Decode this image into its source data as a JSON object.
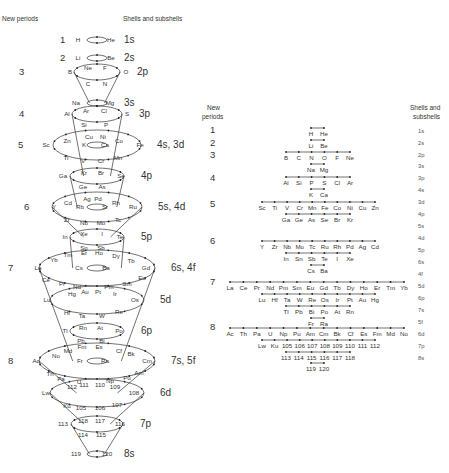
{
  "left_panel": {
    "header_periods": "New periods",
    "header_shells": "Shells and subshells",
    "rings": [
      {
        "period": "1",
        "shell": "1s",
        "cy": 40,
        "rx": 10,
        "ry": 3,
        "elements": [
          {
            "s": "H",
            "x": 78,
            "y": 42
          },
          {
            "s": "He",
            "x": 111,
            "y": 42
          }
        ]
      },
      {
        "period": "2",
        "shell": "2s",
        "cy": 58,
        "rx": 10,
        "ry": 3,
        "elements": [
          {
            "s": "Li",
            "x": 78,
            "y": 60
          },
          {
            "s": "Be",
            "x": 111,
            "y": 60
          }
        ]
      },
      {
        "period": "3",
        "shell": "2p",
        "cy": 72,
        "rx": 23,
        "ry": 8,
        "elements": [
          {
            "s": "B",
            "x": 70,
            "y": 74
          },
          {
            "s": "Ne",
            "x": 88,
            "y": 70
          },
          {
            "s": "F",
            "x": 105,
            "y": 70
          },
          {
            "s": "O",
            "x": 126,
            "y": 74
          },
          {
            "s": "C",
            "x": 88,
            "y": 86
          },
          {
            "s": "N",
            "x": 105,
            "y": 86
          }
        ]
      },
      {
        "period": "",
        "shell": "3s",
        "cy": 103,
        "rx": 10,
        "ry": 3,
        "elements": [
          {
            "s": "Na",
            "x": 76,
            "y": 105
          },
          {
            "s": "Mg",
            "x": 110,
            "y": 105
          }
        ]
      },
      {
        "period": "4",
        "shell": "3p",
        "cy": 114,
        "rx": 25,
        "ry": 8,
        "elements": [
          {
            "s": "Al",
            "x": 67,
            "y": 116
          },
          {
            "s": "Ar",
            "x": 86,
            "y": 113
          },
          {
            "s": "Cl",
            "x": 104,
            "y": 113
          },
          {
            "s": "S",
            "x": 127,
            "y": 116
          },
          {
            "s": "Si",
            "x": 84,
            "y": 127
          },
          {
            "s": "P",
            "x": 106,
            "y": 127
          }
        ]
      },
      {
        "period": "5",
        "shell": "4s, 3d",
        "cy": 145,
        "rx": 44,
        "ry": 15,
        "inner_rx": 10,
        "inner_ry": 3,
        "elements": [
          {
            "s": "Sc",
            "x": 46,
            "y": 147
          },
          {
            "s": "Zn",
            "x": 67,
            "y": 143
          },
          {
            "s": "Cu",
            "x": 89,
            "y": 139
          },
          {
            "s": "Ni",
            "x": 103,
            "y": 139
          },
          {
            "s": "Co",
            "x": 119,
            "y": 143
          },
          {
            "s": "Fe",
            "x": 140,
            "y": 147
          },
          {
            "s": "K",
            "x": 84,
            "y": 147
          },
          {
            "s": "Ca",
            "x": 105,
            "y": 147
          },
          {
            "s": "Ti",
            "x": 66,
            "y": 160
          },
          {
            "s": "V",
            "x": 83,
            "y": 163
          },
          {
            "s": "Cr",
            "x": 101,
            "y": 163
          },
          {
            "s": "Mn",
            "x": 118,
            "y": 160
          }
        ]
      },
      {
        "period": "",
        "shell": "4p",
        "cy": 176,
        "rx": 27,
        "ry": 8,
        "elements": [
          {
            "s": "Ga",
            "x": 63,
            "y": 178
          },
          {
            "s": "Kr",
            "x": 84,
            "y": 175
          },
          {
            "s": "Br",
            "x": 101,
            "y": 175
          },
          {
            "s": "Se",
            "x": 121,
            "y": 178
          },
          {
            "s": "Ge",
            "x": 83,
            "y": 189
          },
          {
            "s": "As",
            "x": 102,
            "y": 189
          }
        ]
      },
      {
        "period": "6",
        "shell": "5s, 4d",
        "cy": 207,
        "rx": 45,
        "ry": 15,
        "inner_rx": 10,
        "inner_ry": 3,
        "elements": [
          {
            "s": "Y",
            "x": 54,
            "y": 209
          },
          {
            "s": "Cd",
            "x": 68,
            "y": 205
          },
          {
            "s": "Ag",
            "x": 87,
            "y": 201
          },
          {
            "s": "Pd",
            "x": 98,
            "y": 201
          },
          {
            "s": "Rh",
            "x": 116,
            "y": 205
          },
          {
            "s": "Ru",
            "x": 133,
            "y": 209
          },
          {
            "s": "Rb",
            "x": 80,
            "y": 209
          },
          {
            "s": "Sr",
            "x": 105,
            "y": 209
          },
          {
            "s": "Zr",
            "x": 67,
            "y": 222
          },
          {
            "s": "Nb",
            "x": 84,
            "y": 225
          },
          {
            "s": "Mo",
            "x": 101,
            "y": 225
          },
          {
            "s": "Tc",
            "x": 118,
            "y": 222
          }
        ]
      },
      {
        "period": "",
        "shell": "5p",
        "cy": 237,
        "rx": 27,
        "ry": 8,
        "elements": [
          {
            "s": "In",
            "x": 65,
            "y": 239
          },
          {
            "s": "Xe",
            "x": 84,
            "y": 236
          },
          {
            "s": "I",
            "x": 102,
            "y": 236
          },
          {
            "s": "Te",
            "x": 120,
            "y": 239
          },
          {
            "s": "Sn",
            "x": 84,
            "y": 250
          },
          {
            "s": "Sb",
            "x": 101,
            "y": 250
          }
        ]
      },
      {
        "period": "7",
        "shell": "6s, 4f",
        "cy": 268,
        "rx": 58,
        "ry": 18,
        "inner_rx": 10,
        "inner_ry": 3,
        "elements": [
          {
            "s": "La",
            "x": 38,
            "y": 270
          },
          {
            "s": "Yb",
            "x": 54,
            "y": 262
          },
          {
            "s": "Tm",
            "x": 68,
            "y": 257
          },
          {
            "s": "Er",
            "x": 84,
            "y": 255
          },
          {
            "s": "Ho",
            "x": 99,
            "y": 255
          },
          {
            "s": "Dy",
            "x": 116,
            "y": 258
          },
          {
            "s": "Tb",
            "x": 131,
            "y": 263
          },
          {
            "s": "Gd",
            "x": 146,
            "y": 270
          },
          {
            "s": "Cs",
            "x": 79,
            "y": 270
          },
          {
            "s": "Ba",
            "x": 106,
            "y": 270
          },
          {
            "s": "Ce",
            "x": 46,
            "y": 282
          },
          {
            "s": "Pr",
            "x": 62,
            "y": 286
          },
          {
            "s": "Nd",
            "x": 77,
            "y": 289
          },
          {
            "s": "Pm",
            "x": 109,
            "y": 289
          },
          {
            "s": "Sm",
            "x": 127,
            "y": 286
          },
          {
            "s": "Eu",
            "x": 142,
            "y": 280
          }
        ]
      },
      {
        "period": "",
        "shell": "5d",
        "cy": 300,
        "rx": 47,
        "ry": 14,
        "elements": [
          {
            "s": "Lu",
            "x": 47,
            "y": 302
          },
          {
            "s": "Hg",
            "x": 72,
            "y": 296
          },
          {
            "s": "Au",
            "x": 85,
            "y": 294
          },
          {
            "s": "Pt",
            "x": 98,
            "y": 294
          },
          {
            "s": "Ir",
            "x": 115,
            "y": 296
          },
          {
            "s": "Os",
            "x": 135,
            "y": 302
          },
          {
            "s": "Hf",
            "x": 67,
            "y": 315
          },
          {
            "s": "Ta",
            "x": 82,
            "y": 318
          },
          {
            "s": "W",
            "x": 102,
            "y": 318
          },
          {
            "s": "Re",
            "x": 119,
            "y": 314
          }
        ]
      },
      {
        "period": "",
        "shell": "6p",
        "cy": 331,
        "rx": 27,
        "ry": 8,
        "elements": [
          {
            "s": "Tl",
            "x": 65,
            "y": 333
          },
          {
            "s": "Rn",
            "x": 83,
            "y": 330
          },
          {
            "s": "At",
            "x": 100,
            "y": 330
          },
          {
            "s": "Po",
            "x": 119,
            "y": 333
          },
          {
            "s": "Pb",
            "x": 81,
            "y": 343
          },
          {
            "s": "Bi",
            "x": 102,
            "y": 343
          }
        ]
      },
      {
        "period": "8",
        "shell": "7s, 5f",
        "cy": 361,
        "rx": 58,
        "ry": 18,
        "inner_rx": 10,
        "inner_ry": 3,
        "elements": [
          {
            "s": "Ac",
            "x": 36,
            "y": 363
          },
          {
            "s": "No",
            "x": 56,
            "y": 358
          },
          {
            "s": "Md",
            "x": 68,
            "y": 353
          },
          {
            "s": "Fm",
            "x": 82,
            "y": 349
          },
          {
            "s": "Es",
            "x": 99,
            "y": 349
          },
          {
            "s": "Cf",
            "x": 119,
            "y": 353
          },
          {
            "s": "Bk",
            "x": 131,
            "y": 356
          },
          {
            "s": "Cm",
            "x": 147,
            "y": 363
          },
          {
            "s": "Fr",
            "x": 80,
            "y": 363
          },
          {
            "s": "Ra",
            "x": 105,
            "y": 363
          },
          {
            "s": "Th",
            "x": 50,
            "y": 376
          },
          {
            "s": "Pa",
            "x": 61,
            "y": 381
          },
          {
            "s": "U",
            "x": 79,
            "y": 384
          },
          {
            "s": "Np",
            "x": 110,
            "y": 383
          },
          {
            "s": "Pu",
            "x": 127,
            "y": 380
          },
          {
            "s": "Am",
            "x": 139,
            "y": 375
          }
        ]
      },
      {
        "period": "",
        "shell": "6d",
        "cy": 393,
        "rx": 47,
        "ry": 14,
        "elements": [
          {
            "s": "Lw",
            "x": 46,
            "y": 395
          },
          {
            "s": "112",
            "x": 72,
            "y": 389
          },
          {
            "s": "111",
            "x": 84,
            "y": 387
          },
          {
            "s": "110",
            "x": 100,
            "y": 387
          },
          {
            "s": "109",
            "x": 115,
            "y": 389
          },
          {
            "s": "108",
            "x": 134,
            "y": 395
          },
          {
            "s": "Ku",
            "x": 67,
            "y": 408
          },
          {
            "s": "105",
            "x": 81,
            "y": 410
          },
          {
            "s": "106",
            "x": 100,
            "y": 410
          },
          {
            "s": "107",
            "x": 117,
            "y": 407
          }
        ]
      },
      {
        "period": "",
        "shell": "7p",
        "cy": 424,
        "rx": 26,
        "ry": 8,
        "elements": [
          {
            "s": "113",
            "x": 63,
            "y": 426
          },
          {
            "s": "118",
            "x": 83,
            "y": 423
          },
          {
            "s": "117",
            "x": 100,
            "y": 423
          },
          {
            "s": "116",
            "x": 120,
            "y": 426
          },
          {
            "s": "114",
            "x": 83,
            "y": 437
          },
          {
            "s": "115",
            "x": 101,
            "y": 437
          }
        ]
      },
      {
        "period": "",
        "shell": "8s",
        "cy": 454,
        "rx": 10,
        "ry": 3,
        "elements": [
          {
            "s": "119",
            "x": 76,
            "y": 456
          },
          {
            "s": "120",
            "x": 107,
            "y": 456
          }
        ]
      }
    ]
  },
  "right_panel": {
    "header_periods_line1": "New",
    "header_periods_line2": "periods",
    "header_shells_line1": "Shells and",
    "header_shells_line2": "subshells",
    "periods": [
      {
        "label": "1",
        "y": 133
      },
      {
        "label": "2",
        "y": 146
      },
      {
        "label": "3",
        "y": 158
      },
      {
        "label": "4",
        "y": 181
      },
      {
        "label": "5",
        "y": 207
      },
      {
        "label": "6",
        "y": 244
      },
      {
        "label": "7",
        "y": 285
      },
      {
        "label": "8",
        "y": 330
      }
    ],
    "shells": [
      {
        "label": "1s",
        "y": 133
      },
      {
        "label": "2s",
        "y": 145
      },
      {
        "label": "2p",
        "y": 157
      },
      {
        "label": "3s",
        "y": 168
      },
      {
        "label": "3p",
        "y": 180
      },
      {
        "label": "4s",
        "y": 192
      },
      {
        "label": "3d",
        "y": 204
      },
      {
        "label": "4p",
        "y": 216
      },
      {
        "label": "5s",
        "y": 228
      },
      {
        "label": "4d",
        "y": 240
      },
      {
        "label": "5p",
        "y": 252
      },
      {
        "label": "6s",
        "y": 264
      },
      {
        "label": "4f",
        "y": 276
      },
      {
        "label": "5d",
        "y": 288
      },
      {
        "label": "6p",
        "y": 300
      },
      {
        "label": "7s",
        "y": 312
      },
      {
        "label": "5f",
        "y": 324
      },
      {
        "label": "6d",
        "y": 336
      },
      {
        "label": "7p",
        "y": 348
      },
      {
        "label": "8s",
        "y": 360
      }
    ],
    "rows": [
      {
        "y": 136,
        "x0": 311,
        "x1": 324,
        "items": [
          "H",
          "He"
        ]
      },
      {
        "y": 148,
        "x0": 311,
        "x1": 324,
        "items": [
          "Li",
          "Be"
        ]
      },
      {
        "y": 160,
        "x0": 286,
        "x1": 350,
        "items": [
          "B",
          "C",
          "N",
          "O",
          "F",
          "Ne"
        ]
      },
      {
        "y": 172,
        "x0": 311,
        "x1": 324,
        "items": [
          "Na",
          "Mg"
        ]
      },
      {
        "y": 185,
        "x0": 286,
        "x1": 350,
        "items": [
          "Al",
          "Si",
          "P",
          "S",
          "Cl",
          "Ar"
        ]
      },
      {
        "y": 197,
        "x0": 311,
        "x1": 324,
        "items": [
          "K",
          "Ca"
        ]
      },
      {
        "y": 210,
        "x0": 262,
        "x1": 375,
        "items": [
          "Sc",
          "Ti",
          "V",
          "Cr",
          "Mn",
          "Fe",
          "Co",
          "Ni",
          "Cu",
          "Zn"
        ]
      },
      {
        "y": 222,
        "x0": 286,
        "x1": 350,
        "items": [
          "Ga",
          "Ge",
          "As",
          "Se",
          "Br",
          "Kr"
        ]
      },
      {
        "y": 234,
        "x0": 311,
        "x1": 324,
        "items": [
          "Cs",
          "Ba"
        ],
        "hidden": true
      },
      {
        "y": 249,
        "x0": 262,
        "x1": 375,
        "items": [
          "Y",
          "Zr",
          "Nb",
          "Mo",
          "Tc",
          "Ru",
          "Rh",
          "Pd",
          "Ag",
          "Cd"
        ]
      },
      {
        "y": 261,
        "x0": 286,
        "x1": 350,
        "items": [
          "In",
          "Sn",
          "Sb",
          "Te",
          "I",
          "Xe"
        ]
      },
      {
        "y": 273,
        "x0": 311,
        "x1": 324,
        "items": [
          "Cs",
          "Ba"
        ]
      },
      {
        "y": 290,
        "x0": 230,
        "x1": 404,
        "items": [
          "La",
          "Ce",
          "Pr",
          "Nd",
          "Pm",
          "Sm",
          "Eu",
          "Gd",
          "Tb",
          "Dy",
          "Ho",
          "Er",
          "Tm",
          "Yb"
        ]
      },
      {
        "y": 302,
        "x0": 262,
        "x1": 375,
        "items": [
          "Lu",
          "Hf",
          "Ta",
          "W",
          "Re",
          "Os",
          "Ir",
          "Pt",
          "Au",
          "Hg"
        ]
      },
      {
        "y": 314,
        "x0": 286,
        "x1": 350,
        "items": [
          "Tl",
          "Pb",
          "Bi",
          "Po",
          "At",
          "Rn"
        ]
      },
      {
        "y": 326,
        "x0": 311,
        "x1": 324,
        "items": [
          "Fr",
          "Ra"
        ]
      },
      {
        "y": 336,
        "x0": 230,
        "x1": 404,
        "items": [
          "Ac",
          "Th",
          "Pa",
          "U",
          "Np",
          "Pu",
          "Am",
          "Cm",
          "Bk",
          "Cf",
          "Es",
          "Fm",
          "Md",
          "No"
        ]
      },
      {
        "y": 348,
        "x0": 262,
        "x1": 375,
        "items": [
          "Lw",
          "Ku",
          "105",
          "106",
          "107",
          "108",
          "109",
          "110",
          "111",
          "112"
        ]
      },
      {
        "y": 360,
        "x0": 286,
        "x1": 350,
        "items": [
          "113",
          "114",
          "115",
          "116",
          "117",
          "118"
        ]
      },
      {
        "y": 371,
        "x0": 311,
        "x1": 324,
        "items": [
          "119",
          "120"
        ]
      }
    ]
  }
}
